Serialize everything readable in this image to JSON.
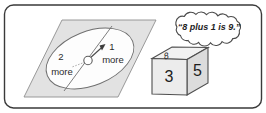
{
  "scene": {
    "title": "Spinner and number cube math illustration",
    "border_color": "#3a3a3a",
    "background_color": "#ffffff"
  },
  "spinner": {
    "name": "spinner",
    "board_color": "#e2e2e2",
    "dial_color": "#fdfdfd",
    "pointer_direction": "upper-right",
    "sectors": [
      {
        "number": "1",
        "label": "more"
      },
      {
        "number": "2",
        "label": "more"
      }
    ]
  },
  "speech_bubble": {
    "name": "speech-bubble",
    "text": "“8 plus 1 is 9.”"
  },
  "number_cube": {
    "name": "number-cube",
    "front_face": "3",
    "right_face": "5",
    "top_face": "8",
    "front_color": "#ececec",
    "side_color": "#dcdcdc",
    "top_color": "#f2f2f2"
  }
}
